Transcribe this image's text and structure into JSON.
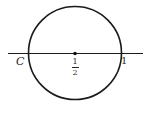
{
  "diagram": {
    "colors": {
      "stroke": "#1a1a1a",
      "text": "#2a2a2a",
      "background": "#ffffff"
    },
    "line": {
      "x1": 8,
      "y1": 53.5,
      "x2": 143,
      "y2": 53.5
    },
    "circle": {
      "cx": 75,
      "cy": 53,
      "r": 46.5
    },
    "center_point": {
      "cx": 75,
      "cy": 53.5,
      "r": 1.8
    },
    "labels": {
      "left_point": "C",
      "center_numerator": "1",
      "center_denominator": "2",
      "right_point": "1"
    }
  }
}
